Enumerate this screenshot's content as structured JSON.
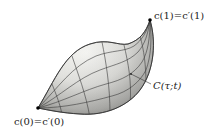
{
  "figure": {
    "start_point": {
      "label": "c(0)=c′(0)",
      "x": 38,
      "y": 108
    },
    "end_point": {
      "label": "c(1)=c′(1)",
      "x": 150,
      "y": 20
    },
    "surface_label": "C(τ;t)",
    "colors": {
      "surface_light": "#f4f4f0",
      "surface_dark": "#8a8a86",
      "grid_line": "#3a3a3a",
      "outline": "#2a2a2a",
      "point": "#000000",
      "background": "#ffffff"
    }
  }
}
